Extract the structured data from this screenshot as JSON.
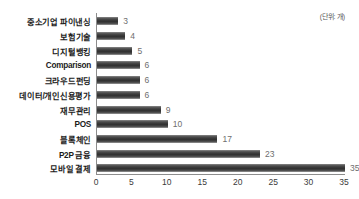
{
  "chart_data": {
    "type": "bar",
    "orientation": "horizontal",
    "title": "",
    "subtitle": "",
    "xlabel": "",
    "ylabel": "",
    "unit_note": "(단위: 개)",
    "categories": [
      "중소기업 파이낸싱",
      "보험기술",
      "디지털뱅킹",
      "Comparison",
      "크라우드펀딩",
      "데이터/개인신용평가",
      "재무관리",
      "POS",
      "블록체인",
      "P2P 금융",
      "모바일 결제"
    ],
    "values": [
      3,
      4,
      5,
      6,
      6,
      6,
      9,
      10,
      17,
      23,
      35
    ],
    "value_labels": [
      "3",
      "4",
      "5",
      "6",
      "6",
      "6",
      "9",
      "10",
      "17",
      "23",
      "35"
    ],
    "xlim": [
      0,
      35
    ],
    "xticks": [
      0,
      5,
      10,
      15,
      20,
      25,
      30,
      35
    ],
    "xtick_labels": [
      "0",
      "5",
      "10",
      "15",
      "20",
      "25",
      "30",
      "35"
    ],
    "grid": false,
    "legend": null,
    "colors": {
      "bar_light": "#8e8e8e",
      "bar_dark": "#313131",
      "axis": "#8d8d8d",
      "category_text": "#1b1b1b",
      "value_text": "#6e6e6e",
      "tick_text": "#3a3a3a",
      "background": "#ffffff"
    }
  }
}
